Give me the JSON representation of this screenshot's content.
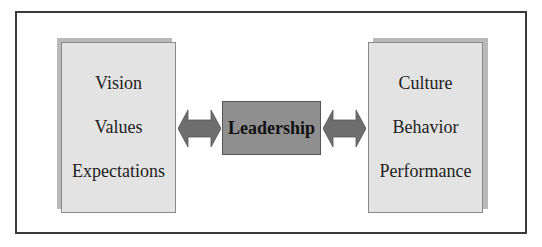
{
  "diagram": {
    "center": {
      "label": "Leadership"
    },
    "left_box": {
      "items": [
        "Vision",
        "Values",
        "Expectations"
      ]
    },
    "right_box": {
      "items": [
        "Culture",
        "Behavior",
        "Performance"
      ]
    },
    "connectors": [
      {
        "from": "left_box",
        "to": "center",
        "type": "bidirectional-arrow"
      },
      {
        "from": "center",
        "to": "right_box",
        "type": "bidirectional-arrow"
      }
    ],
    "colors": {
      "center_fill": "#8f8f8f",
      "panel_fill": "#e3e3e3",
      "arrow_fill": "#6e6e6e",
      "frame": "#3a3a3a"
    }
  }
}
